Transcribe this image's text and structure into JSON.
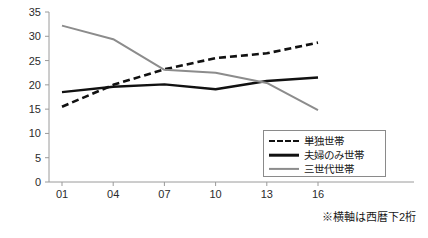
{
  "chart_data": {
    "type": "line",
    "title": "",
    "subtitle": "",
    "xlabel": "",
    "ylabel": "",
    "categories": [
      "01",
      "04",
      "07",
      "10",
      "13",
      "16"
    ],
    "x": [
      1,
      4,
      7,
      10,
      13,
      16
    ],
    "xlim": [
      0,
      17
    ],
    "ylim": [
      0,
      35
    ],
    "yticks": [
      0,
      5,
      10,
      15,
      20,
      25,
      30,
      35
    ],
    "grid": false,
    "legend_position": "bottom-right",
    "series": [
      {
        "name": "単独世帯",
        "style": "dashed",
        "color": "#111111",
        "values": [
          15.5,
          20.0,
          23.2,
          25.5,
          26.5,
          28.7
        ]
      },
      {
        "name": "夫婦のみ世帯",
        "style": "solid",
        "color": "#111111",
        "values": [
          18.5,
          19.6,
          20.1,
          19.1,
          20.8,
          21.5
        ]
      },
      {
        "name": "三世代世帯",
        "style": "solid",
        "color": "#8c8c8c",
        "values": [
          32.2,
          29.4,
          23.1,
          22.5,
          20.4,
          14.8
        ]
      }
    ],
    "annotations": [
      "※横軸は西暦下2桁"
    ]
  },
  "legend": {
    "items": [
      {
        "label": "単独世帯",
        "swatch": "dashed-black-line"
      },
      {
        "label": "夫婦のみ世帯",
        "swatch": "solid-black-line"
      },
      {
        "label": "三世代世帯",
        "swatch": "solid-gray-line"
      }
    ]
  },
  "footnote": {
    "text": "※横軸は西暦下2桁"
  },
  "axes": {
    "y_tick_labels": [
      "0",
      "5",
      "10",
      "15",
      "20",
      "25",
      "30",
      "35"
    ],
    "x_tick_labels": [
      "01",
      "04",
      "07",
      "10",
      "13",
      "16"
    ]
  },
  "colors": {
    "axis": "#9a9a9a",
    "series_dark": "#111111",
    "series_gray": "#8c8c8c",
    "background": "#ffffff"
  }
}
